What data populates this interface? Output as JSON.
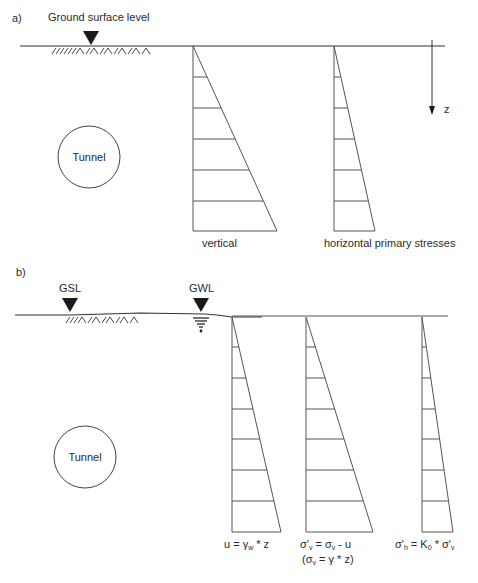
{
  "panel_a": {
    "label": "a)",
    "ground_marker_label": "Ground surface level",
    "depth_axis_label": "z",
    "tunnel_label": "Tunnel",
    "diagrams": [
      {
        "name": "vertical",
        "label": "vertical",
        "width_ratio": 1.0
      },
      {
        "name": "horizontal",
        "label": "horizontal primary stresses",
        "width_ratio": 0.49
      }
    ]
  },
  "panel_b": {
    "label": "b)",
    "gsl_label": "GSL",
    "gwl_label": "GWL",
    "tunnel_label": "Tunnel",
    "diagrams": [
      {
        "name": "pore-water-pressure",
        "formula": "u = γw * z",
        "parts": {
          "a": "u = γ",
          "sub": "w",
          "b": " * z"
        }
      },
      {
        "name": "effective-vertical-stress",
        "formula": "σ'v = σv - u (σv = γ * z)",
        "line1": {
          "a": "σ'",
          "sub1": "v",
          "b": " = σ",
          "sub2": "v",
          "c": " - u"
        },
        "line2": {
          "a": "(σ",
          "sub": "v",
          "b": " = γ * z)"
        }
      },
      {
        "name": "effective-horizontal-stress",
        "formula": "σ'h = K0 * σ'v",
        "parts": {
          "a": "σ'",
          "sub1": "h",
          "b": " = K",
          "sub2": "0",
          "c": " * σ'",
          "sub3": "v"
        }
      }
    ]
  },
  "colors": {
    "stroke": "#555555",
    "ground": "#333333",
    "text": "#2a2a2a",
    "marker": "#1a1a1a"
  }
}
